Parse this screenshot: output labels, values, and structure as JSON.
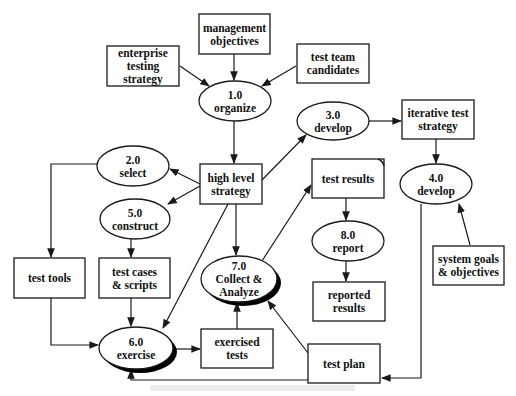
{
  "diagram": {
    "colors": {
      "stroke": "#1a1a1a",
      "fill": "#ffffff",
      "text": "#111111",
      "shadow": "#000000"
    },
    "nodes": [
      {
        "id": "management-objectives",
        "shape": "box",
        "lines": [
          "management",
          "objectives"
        ],
        "x": 199,
        "y": 14,
        "w": 71,
        "h": 40
      },
      {
        "id": "enterprise-testing-strategy",
        "shape": "box",
        "lines": [
          "enterprise",
          "testing",
          "strategy"
        ],
        "x": 107,
        "y": 46,
        "w": 72,
        "h": 40
      },
      {
        "id": "test-team-candidates",
        "shape": "box",
        "lines": [
          "test team",
          "candidates"
        ],
        "x": 297,
        "y": 44,
        "w": 72,
        "h": 39
      },
      {
        "id": "1.0-organize",
        "shape": "ellipse",
        "lines": [
          "1.0",
          "organize"
        ],
        "cx": 235,
        "cy": 101,
        "rx": 36,
        "ry": 20
      },
      {
        "id": "3.0-develop",
        "shape": "ellipse",
        "lines": [
          "3.0",
          "develop"
        ],
        "cx": 333,
        "cy": 121,
        "rx": 36,
        "ry": 19
      },
      {
        "id": "iterative-test-strategy",
        "shape": "box",
        "lines": [
          "iterative test",
          "strategy"
        ],
        "x": 402,
        "y": 100,
        "w": 72,
        "h": 39
      },
      {
        "id": "2.0-select",
        "shape": "ellipse",
        "lines": [
          "2.0",
          "select"
        ],
        "cx": 133,
        "cy": 166,
        "rx": 36,
        "ry": 20
      },
      {
        "id": "high-level-strategy",
        "shape": "box",
        "lines": [
          "high level",
          "strategy"
        ],
        "x": 200,
        "y": 164,
        "w": 62,
        "h": 40
      },
      {
        "id": "test-results",
        "shape": "box",
        "lines": [
          "test results"
        ],
        "x": 312,
        "y": 159,
        "w": 72,
        "h": 39,
        "curl": true
      },
      {
        "id": "4.0-develop",
        "shape": "ellipse",
        "lines": [
          "4.0",
          "develop"
        ],
        "cx": 436,
        "cy": 184,
        "rx": 36,
        "ry": 20
      },
      {
        "id": "5.0-construct",
        "shape": "ellipse",
        "lines": [
          "5.0",
          "construct"
        ],
        "cx": 135,
        "cy": 219,
        "rx": 35,
        "ry": 20
      },
      {
        "id": "8.0-report",
        "shape": "ellipse",
        "lines": [
          "8.0",
          "report"
        ],
        "cx": 348,
        "cy": 241,
        "rx": 36,
        "ry": 20
      },
      {
        "id": "system-goals-objectives",
        "shape": "box",
        "lines": [
          "system goals",
          "& objectives"
        ],
        "x": 433,
        "y": 246,
        "w": 71,
        "h": 39
      },
      {
        "id": "test-tools",
        "shape": "box",
        "lines": [
          "test tools"
        ],
        "x": 14,
        "y": 258,
        "w": 71,
        "h": 40
      },
      {
        "id": "test-cases-scripts",
        "shape": "box",
        "lines": [
          "test cases",
          "& scripts"
        ],
        "x": 99,
        "y": 258,
        "w": 71,
        "h": 40
      },
      {
        "id": "7.0-collect-analyze",
        "shape": "ellipse",
        "lines": [
          "7.0",
          "Collect &",
          "Analyze"
        ],
        "cx": 239,
        "cy": 279,
        "rx": 38,
        "ry": 23,
        "shadow": true
      },
      {
        "id": "reported-results",
        "shape": "box",
        "lines": [
          "reported",
          "results"
        ],
        "x": 313,
        "y": 282,
        "w": 72,
        "h": 39
      },
      {
        "id": "6.0-exercise",
        "shape": "ellipse",
        "lines": [
          "6.0",
          "exercise"
        ],
        "cx": 136,
        "cy": 348,
        "rx": 37,
        "ry": 21,
        "shadow": true
      },
      {
        "id": "exercised-tests",
        "shape": "box",
        "lines": [
          "exercised",
          "tests"
        ],
        "x": 201,
        "y": 329,
        "w": 72,
        "h": 39
      },
      {
        "id": "test-plan",
        "shape": "box",
        "lines": [
          "test plan"
        ],
        "x": 308,
        "y": 344,
        "w": 72,
        "h": 39
      }
    ],
    "edges": [
      {
        "from": "management-objectives",
        "to": "1.0-organize",
        "points": [
          [
            234,
            54
          ],
          [
            234,
            80
          ]
        ]
      },
      {
        "from": "enterprise-testing-strategy",
        "to": "1.0-organize",
        "points": [
          [
            180,
            66
          ],
          [
            209,
            86
          ]
        ]
      },
      {
        "from": "test-team-candidates",
        "to": "1.0-organize",
        "points": [
          [
            296,
            66
          ],
          [
            262,
            86
          ]
        ]
      },
      {
        "from": "1.0-organize",
        "to": "high-level-strategy",
        "points": [
          [
            234,
            121
          ],
          [
            234,
            163
          ]
        ]
      },
      {
        "from": "high-level-strategy",
        "to": "2.0-select",
        "points": [
          [
            200,
            184
          ],
          [
            170,
            169
          ]
        ]
      },
      {
        "from": "high-level-strategy",
        "to": "5.0-construct",
        "points": [
          [
            200,
            186
          ],
          [
            168,
            204
          ]
        ]
      },
      {
        "from": "high-level-strategy",
        "to": "3.0-develop",
        "points": [
          [
            262,
            180
          ],
          [
            306,
            135
          ]
        ]
      },
      {
        "from": "high-level-strategy",
        "to": "7.0-collect-analyze",
        "points": [
          [
            236,
            204
          ],
          [
            236,
            255
          ]
        ]
      },
      {
        "from": "high-level-strategy",
        "to": "6.0-exercise",
        "points": [
          [
            228,
            204
          ],
          [
            163,
            328
          ]
        ]
      },
      {
        "from": "3.0-develop",
        "to": "iterative-test-strategy",
        "points": [
          [
            369,
            121
          ],
          [
            401,
            121
          ]
        ]
      },
      {
        "from": "iterative-test-strategy",
        "to": "4.0-develop",
        "points": [
          [
            436,
            139
          ],
          [
            436,
            163
          ]
        ]
      },
      {
        "from": "system-goals-objectives",
        "to": "4.0-develop",
        "points": [
          [
            470,
            245
          ],
          [
            459,
            204
          ]
        ]
      },
      {
        "from": "4.0-develop",
        "to": "test-plan",
        "points": [
          [
            421,
            204
          ],
          [
            421,
            378
          ],
          [
            382,
            378
          ]
        ]
      },
      {
        "from": "2.0-select",
        "to": "test-tools",
        "points": [
          [
            97,
            164
          ],
          [
            51,
            164
          ],
          [
            51,
            257
          ]
        ]
      },
      {
        "from": "5.0-construct",
        "to": "test-cases-scripts",
        "points": [
          [
            131,
            239
          ],
          [
            131,
            257
          ]
        ]
      },
      {
        "from": "test-cases-scripts",
        "to": "6.0-exercise",
        "points": [
          [
            131,
            298
          ],
          [
            131,
            326
          ]
        ]
      },
      {
        "from": "test-tools",
        "to": "6.0-exercise",
        "points": [
          [
            51,
            298
          ],
          [
            51,
            345
          ],
          [
            98,
            345
          ]
        ]
      },
      {
        "from": "6.0-exercise",
        "to": "exercised-tests",
        "points": [
          [
            174,
            349
          ],
          [
            200,
            349
          ]
        ]
      },
      {
        "from": "exercised-tests",
        "to": "7.0-collect-analyze",
        "points": [
          [
            237,
            329
          ],
          [
            237,
            303
          ]
        ]
      },
      {
        "from": "7.0-collect-analyze",
        "to": "test-results",
        "points": [
          [
            262,
            261
          ],
          [
            311,
            185
          ]
        ]
      },
      {
        "from": "test-plan",
        "to": "7.0-collect-analyze",
        "points": [
          [
            308,
            353
          ],
          [
            268,
            301
          ]
        ]
      },
      {
        "from": "test-plan",
        "to": "6.0-exercise",
        "points": [
          [
            308,
            380
          ],
          [
            131,
            380
          ],
          [
            131,
            370
          ]
        ]
      },
      {
        "from": "test-results",
        "to": "8.0-report",
        "points": [
          [
            346,
            198
          ],
          [
            346,
            220
          ]
        ]
      },
      {
        "from": "8.0-report",
        "to": "reported-results",
        "points": [
          [
            346,
            261
          ],
          [
            346,
            281
          ]
        ]
      }
    ]
  }
}
